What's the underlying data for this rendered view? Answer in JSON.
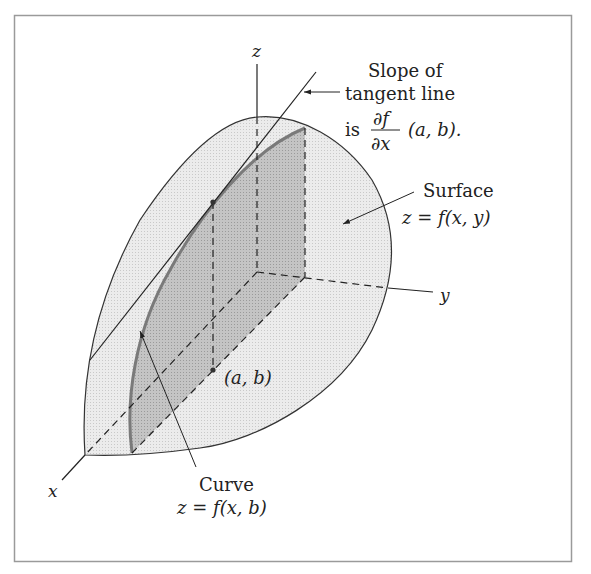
{
  "figure": {
    "axes": {
      "x": "x",
      "y": "y",
      "z": "z"
    },
    "tangent_annotation": {
      "line1": "Slope of",
      "line2": "tangent line",
      "prefix": "is",
      "frac_num": "∂f",
      "frac_den": "∂x",
      "suffix": "(a, b)."
    },
    "surface_annotation": {
      "line1": "Surface",
      "line2": "z = f(x, y)"
    },
    "curve_annotation": {
      "line1": "Curve",
      "line2": "z = f(x, b)"
    },
    "point_label": "(a, b)",
    "colors": {
      "frame": "#9a9a9a",
      "surface_fill": "#e6e6e6",
      "curve_region_fill": "#b8b8b8",
      "curve_stroke": "#7a7a7a",
      "ink": "#222222"
    }
  }
}
